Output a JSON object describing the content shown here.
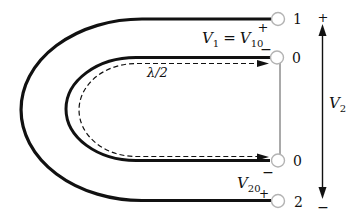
{
  "figure": {
    "kind": "half-wavelength-balun-diagram"
  },
  "colors": {
    "ink": "#111111",
    "terminal_ring": "#b3b3b3",
    "background": "#ffffff"
  },
  "terminals": {
    "t1": "1",
    "t0_top": "0",
    "t0_bottom": "0",
    "t2": "2"
  },
  "labels": {
    "v1": {
      "base": "V",
      "sub": "1"
    },
    "equals": "=",
    "v10": {
      "base": "V",
      "sub": "10"
    },
    "v1_plus": "+",
    "v1_minus": "−",
    "lambda": "λ/2",
    "v2": {
      "base": "V",
      "sub": "2"
    },
    "v2_plus": "+",
    "v2_minus": "−",
    "v20": {
      "base": "V",
      "sub": "20"
    },
    "v20_plus": "+",
    "t0_bottom_minus": "−"
  }
}
